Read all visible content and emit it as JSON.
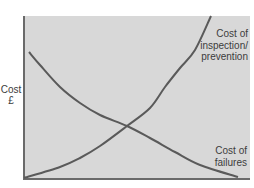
{
  "chart_data": {
    "type": "line",
    "title": "",
    "xlabel": "",
    "ylabel": "Cost £",
    "ylabel_lines": [
      "Cost",
      "£"
    ],
    "grid": false,
    "legend_position": "inline annotations",
    "x_range_px": [
      23,
      250
    ],
    "y_range_px": [
      16,
      179
    ],
    "series": [
      {
        "name": "Cost of inspection/prevention",
        "label_lines": [
          "Cost of",
          "inspection/",
          "prevention"
        ],
        "trend": "increasing exponentially",
        "points": [
          [
            24,
            178
          ],
          [
            60,
            167
          ],
          [
            80,
            158
          ],
          [
            100,
            146
          ],
          [
            127,
            126
          ],
          [
            150,
            108
          ],
          [
            165,
            87
          ],
          [
            180,
            68
          ],
          [
            195,
            50
          ],
          [
            211,
            16
          ]
        ]
      },
      {
        "name": "Cost of failures",
        "label_lines": [
          "Cost of",
          "failures"
        ],
        "trend": "decreasing",
        "points": [
          [
            29,
            52
          ],
          [
            40,
            65
          ],
          [
            60,
            87
          ],
          [
            80,
            103
          ],
          [
            100,
            115
          ],
          [
            127,
            126
          ],
          [
            150,
            138
          ],
          [
            175,
            152
          ],
          [
            200,
            165
          ],
          [
            238,
            177
          ]
        ]
      }
    ],
    "intersection": [
      127,
      126
    ],
    "colors": {
      "plot_bg": "#d8d8d8",
      "line": "#5a5a5a",
      "text": "#3c3c3c"
    }
  }
}
